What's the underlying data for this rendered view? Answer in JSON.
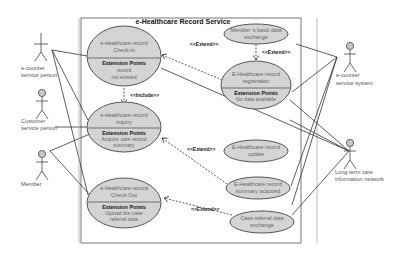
{
  "diagram": {
    "type": "uml-use-case",
    "system_boundary": {
      "title": "e-Healthcare Record Service"
    },
    "actors": [
      {
        "id": "ecounter-person",
        "label_line1": "e-counter",
        "label_line2": "service person"
      },
      {
        "id": "customer-person",
        "label_line1": "Customer",
        "label_line2": "service person"
      },
      {
        "id": "member",
        "label_line1": "Member",
        "label_line2": ""
      },
      {
        "id": "ecounter-system",
        "label_line1": "e-counter",
        "label_line2": "service system"
      },
      {
        "id": "ltc-network",
        "label_line1": "Long-term care",
        "label_line2": "information network"
      }
    ],
    "use_cases": [
      {
        "id": "checkin",
        "line1": "e-Healthcare record",
        "line2": "Check-in",
        "ext_heading": "Extension Points",
        "ext_line1": "record",
        "ext_line2": "not existed"
      },
      {
        "id": "inquiry",
        "line1": "e-Healthcare record",
        "line2": "inquiry",
        "ext_heading": "Extension Points",
        "ext_line1": "Acquire care record",
        "ext_line2": "summary"
      },
      {
        "id": "checkout",
        "line1": "e-Healthcare record",
        "line2": "Check-Out",
        "ext_heading": "Extension Points",
        "ext_line1": "Upload the case",
        "ext_line2": "referral data"
      },
      {
        "id": "basic-data",
        "line1": "Member 's basic data",
        "line2": "exchange"
      },
      {
        "id": "registration",
        "line1": "E-Healthcare record",
        "line2": "registration",
        "ext_heading": "Extension Points",
        "ext_line1": "No data available"
      },
      {
        "id": "update",
        "line1": "E-Healthcare record",
        "line2": "update"
      },
      {
        "id": "summary",
        "line1": "E-Healthcare record",
        "line2": "summary acquired"
      },
      {
        "id": "referral",
        "line1": "Case referral data",
        "line2": "exchange"
      }
    ],
    "relationships": [
      {
        "from": "registration",
        "to": "checkin",
        "stereotype": "<<Extend>>"
      },
      {
        "from": "registration",
        "to": "basic-data",
        "stereotype": "<<Extend>>"
      },
      {
        "from": "checkin",
        "to": "inquiry",
        "stereotype": "<<Include>>"
      },
      {
        "from": "summary",
        "to": "inquiry",
        "stereotype": "<<Extend>>"
      },
      {
        "from": "referral",
        "to": "checkout",
        "stereotype": "<<Extend>>"
      }
    ],
    "colors": {
      "usecase_fill": "#d4d4d4",
      "usecase_stroke": "#555555",
      "line": "#333333",
      "frame": "#777777"
    }
  }
}
